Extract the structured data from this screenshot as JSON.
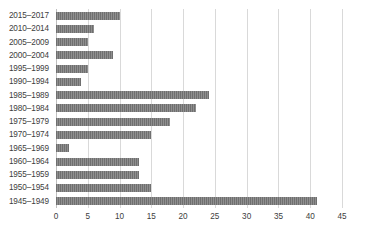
{
  "chart_data": {
    "type": "bar",
    "orientation": "horizontal",
    "title": "",
    "xlabel": "",
    "ylabel": "",
    "xlim": [
      0,
      45
    ],
    "xticks": [
      0,
      5,
      10,
      15,
      20,
      25,
      30,
      35,
      40,
      45
    ],
    "grid": "vertical",
    "legend": "none",
    "bar_color": "#6f6f6f",
    "gridline_color": "#d9d9d9",
    "text_color": "#404040",
    "categories": [
      "2015–2017",
      "2010–2014",
      "2005–2009",
      "2000–2004",
      "1995–1999",
      "1990–1994",
      "1985–1989",
      "1980–1984",
      "1975–1979",
      "1970–1974",
      "1965–1969",
      "1960–1964",
      "1955–1959",
      "1950–1954",
      "1945–1949"
    ],
    "values": [
      10,
      6,
      5,
      9,
      5,
      4,
      24,
      22,
      18,
      15,
      2,
      13,
      13,
      15,
      41
    ]
  }
}
